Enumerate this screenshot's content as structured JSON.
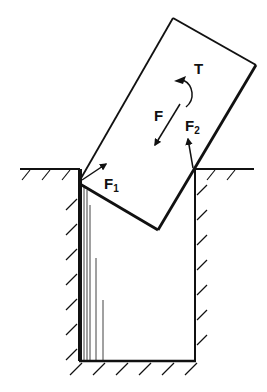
{
  "diagram": {
    "type": "free-body diagram",
    "labels": {
      "torque": "T",
      "force": "F",
      "force1": "F",
      "force1_sub": "1",
      "force2": "F",
      "force2_sub": "2"
    },
    "colors": {
      "ink": "#111111",
      "background": "#ffffff"
    }
  }
}
